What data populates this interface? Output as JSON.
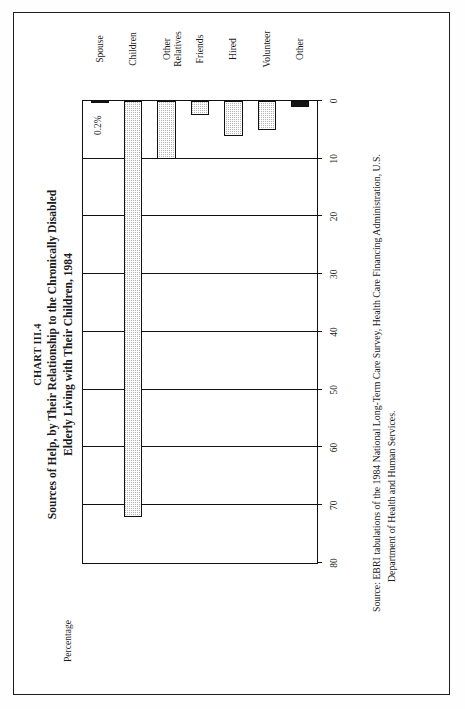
{
  "document": {
    "chart_number": "CHART III.4",
    "title_line1": "Sources of Help, by Their Relationship to the Chronically Disabled",
    "title_line2": "Elderly Living with Their Children, 1984",
    "source_lead": "Source:",
    "source_line1": "EBRI tabulations of the 1984 National Long-Term Care Survey, Health Care Financing Administration, U.S.",
    "source_line2": "Department of Health and Human Services."
  },
  "axis": {
    "y_axis_label": "Percentage",
    "ticks": [
      "80",
      "70",
      "60",
      "50",
      "40",
      "30",
      "20",
      "10",
      "0"
    ]
  },
  "annotations": {
    "spouse_value_label": "0.2%"
  },
  "colors": {
    "ink": "#111111",
    "bar_fill": "#b4b4b4",
    "bar_solid": "#151515",
    "page": "#ffffff"
  },
  "chart_data": {
    "type": "bar",
    "title": "Sources of Help, by Their Relationship to the Chronically Disabled Elderly Living with Their Children, 1984",
    "subtitle": "CHART III.4",
    "orientation": "vertical",
    "categories": [
      "Spouse",
      "Children",
      "Other Relatives",
      "Friends",
      "Hired",
      "Volunteer",
      "Other"
    ],
    "category_labels": [
      "Spouse",
      "Children",
      "Other\nRelatives",
      "Friends",
      "Hired",
      "Volunteer",
      "Other"
    ],
    "values": [
      0.2,
      72,
      10,
      2.5,
      6,
      5,
      1
    ],
    "data_labels": [
      "0.2%",
      "",
      "",
      "",
      "",
      "",
      ""
    ],
    "xlabel": "",
    "ylabel": "Percentage",
    "ylim": [
      0,
      80
    ],
    "ytick_values": [
      0,
      10,
      20,
      30,
      40,
      50,
      60,
      70,
      80
    ],
    "grid": true,
    "legend": false,
    "bar_styles": [
      "none",
      "hatched",
      "hatched",
      "hatched",
      "hatched",
      "hatched",
      "solid"
    ]
  }
}
